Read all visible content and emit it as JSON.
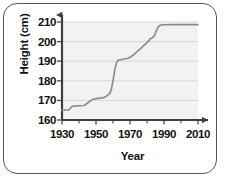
{
  "chart_data": {
    "type": "line",
    "title": "",
    "xlabel": "Year",
    "ylabel": "Height (cm)",
    "xlim": [
      1930,
      2010
    ],
    "ylim": [
      160,
      210
    ],
    "xticks": [
      1930,
      1950,
      1970,
      1990,
      2010
    ],
    "xticklabels": [
      "1930",
      "1950",
      "1970",
      "1990",
      "2010"
    ],
    "xminorticks": [
      1940,
      1960,
      1980,
      2000
    ],
    "yticks": [
      160,
      170,
      180,
      190,
      200,
      210
    ],
    "yticklabels": [
      "160",
      "170",
      "180",
      "190",
      "200",
      "210"
    ],
    "grid": "horizontal",
    "legend": "none",
    "series": [
      {
        "name": "World record high jump height",
        "color": "#8c8c8c",
        "points": [
          [
            1930,
            165.0
          ],
          [
            1934,
            165.2
          ],
          [
            1936,
            167.0
          ],
          [
            1939,
            167.2
          ],
          [
            1943,
            167.4
          ],
          [
            1948,
            170.5
          ],
          [
            1951,
            171.0
          ],
          [
            1954,
            171.3
          ],
          [
            1956,
            172.0
          ],
          [
            1958,
            173.5
          ],
          [
            1959,
            175.5
          ],
          [
            1960,
            180.0
          ],
          [
            1961,
            185.5
          ],
          [
            1962,
            189.0
          ],
          [
            1963,
            190.5
          ],
          [
            1966,
            191.0
          ],
          [
            1969,
            191.5
          ],
          [
            1971,
            192.5
          ],
          [
            1973,
            194.0
          ],
          [
            1975,
            195.5
          ],
          [
            1977,
            197.0
          ],
          [
            1978,
            198.0
          ],
          [
            1980,
            199.5
          ],
          [
            1982,
            201.5
          ],
          [
            1983,
            202.0
          ],
          [
            1984,
            202.5
          ],
          [
            1985,
            204.5
          ],
          [
            1986,
            206.5
          ],
          [
            1987,
            208.0
          ],
          [
            1989,
            208.6
          ],
          [
            1995,
            208.7
          ],
          [
            2005,
            208.7
          ],
          [
            2010,
            208.7
          ]
        ]
      }
    ]
  },
  "plot_colors": {
    "line": "#8c8c8c",
    "axis": "#4a4a4a",
    "grid": "#d8d8d8",
    "plot_background": "#f2f2f2",
    "frame": "#55585c",
    "text": "#111111"
  }
}
